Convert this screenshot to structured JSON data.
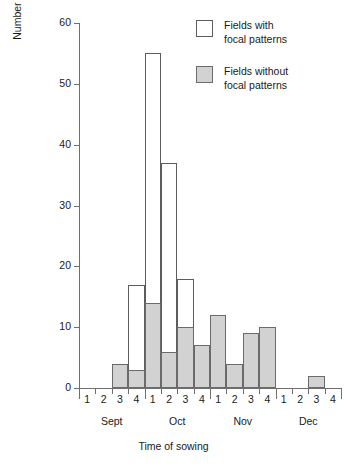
{
  "chart_data": {
    "type": "bar",
    "title": "",
    "xlabel": "Time of sowing",
    "ylabel": "Number of fields",
    "ylim": [
      0,
      60
    ],
    "yticks": [
      0,
      10,
      20,
      30,
      40,
      50,
      60
    ],
    "grid": false,
    "legend_position": "top-right",
    "categories": [
      "Sept 1",
      "Sept 2",
      "Sept 3",
      "Sept 4",
      "Oct 1",
      "Oct 2",
      "Oct 3",
      "Oct 4",
      "Nov 1",
      "Nov 2",
      "Nov 3",
      "Nov 4",
      "Dec 1",
      "Dec 2",
      "Dec 3",
      "Dec 4"
    ],
    "bin_labels": [
      "1",
      "2",
      "3",
      "4",
      "1",
      "2",
      "3",
      "4",
      "1",
      "2",
      "3",
      "4",
      "1",
      "2",
      "3",
      "4"
    ],
    "month_groups": [
      "Sept",
      "Oct",
      "Nov",
      "Dec"
    ],
    "series": [
      {
        "name": "Fields with focal patterns",
        "style": "open",
        "color": "#ffffff",
        "edge_color": "#5d5d5d",
        "values": [
          0,
          0,
          0,
          17,
          55,
          37,
          18,
          0,
          0,
          0,
          0,
          0,
          0,
          0,
          0,
          0
        ]
      },
      {
        "name": "Fields without focal patterns",
        "style": "filled",
        "color": "#d2d2d2",
        "edge_color": "#6b6b6b",
        "values": [
          0,
          0,
          4,
          3,
          14,
          6,
          10,
          7,
          12,
          4,
          9,
          10,
          0,
          0,
          2,
          0
        ]
      }
    ]
  },
  "legend": {
    "items": [
      {
        "label": "Fields with\nfocal patterns",
        "style": "open"
      },
      {
        "label": "Fields without\nfocal patterns",
        "style": "filled"
      }
    ]
  },
  "axes": {
    "y_title": "Number of fields",
    "x_title": "Time of sowing"
  }
}
